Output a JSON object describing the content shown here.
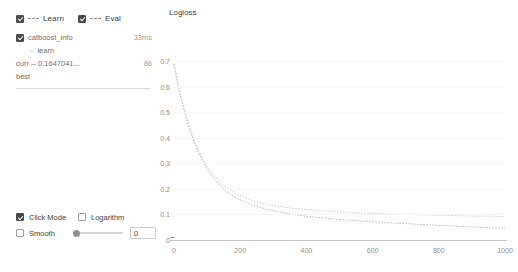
{
  "legend": {
    "items": [
      {
        "label": "Learn",
        "checked": true,
        "style": "dashed",
        "icon": "dashed-line-icon"
      },
      {
        "label": "Eval",
        "checked": true,
        "style": "dashed",
        "icon": "dashed-line-icon"
      }
    ]
  },
  "info_tree": {
    "rows": [
      {
        "name": "catboost_info",
        "right": "33ms",
        "checkbox": true,
        "indent": false,
        "prefix": ""
      },
      {
        "name": "learn",
        "right": "",
        "checkbox": false,
        "indent": true,
        "prefix": "--"
      },
      {
        "name": "curr -- 0.1647041...",
        "right": "86",
        "checkbox": false,
        "indent": false,
        "prefix": ""
      },
      {
        "name": "best",
        "right": "",
        "checkbox": false,
        "indent": false,
        "prefix": ""
      }
    ]
  },
  "controls": {
    "click_mode": {
      "label": "Click Mode",
      "checked": true
    },
    "logarithm": {
      "label": "Logarithm",
      "checked": false
    },
    "smooth": {
      "label": "Smooth",
      "checked": false
    },
    "slider": {
      "value": 0,
      "min": 0,
      "max": 100
    },
    "slider_value_text": "0"
  },
  "chart_data": {
    "type": "line",
    "title": "Logloss",
    "xlabel": "",
    "ylabel": "",
    "xlim": [
      0,
      1000
    ],
    "ylim": [
      0,
      0.72
    ],
    "xticks": [
      0,
      200,
      400,
      600,
      800,
      1000
    ],
    "xtick_labels": [
      "0",
      "200",
      "400",
      "600",
      "800",
      "1000"
    ],
    "yticks": [
      0,
      0.1,
      0.2,
      0.3,
      0.4,
      0.5,
      0.6,
      0.7
    ],
    "ytick_labels": [
      "0",
      "0.1",
      "0.2",
      "0.3",
      "0.4",
      "0.5",
      "0.6",
      "0.7"
    ],
    "grid": true,
    "legend_position": "top-left-panel",
    "series": [
      {
        "name": "Learn",
        "style": "dashed",
        "color": "#b9b9b9",
        "x": [
          0,
          5,
          10,
          15,
          20,
          25,
          30,
          40,
          50,
          60,
          70,
          80,
          90,
          100,
          120,
          140,
          160,
          180,
          200,
          240,
          280,
          320,
          360,
          400,
          460,
          520,
          580,
          640,
          700,
          760,
          820,
          880,
          940,
          1000
        ],
        "y": [
          0.688,
          0.655,
          0.622,
          0.592,
          0.563,
          0.536,
          0.511,
          0.464,
          0.423,
          0.386,
          0.354,
          0.325,
          0.3,
          0.278,
          0.241,
          0.212,
          0.189,
          0.171,
          0.157,
          0.135,
          0.12,
          0.109,
          0.1,
          0.093,
          0.085,
          0.078,
          0.073,
          0.068,
          0.064,
          0.06,
          0.056,
          0.052,
          0.049,
          0.046
        ]
      },
      {
        "name": "Eval",
        "style": "dashed",
        "color": "#cfcfcf",
        "x": [
          0,
          5,
          10,
          15,
          20,
          25,
          30,
          40,
          50,
          60,
          70,
          80,
          90,
          100,
          120,
          140,
          160,
          180,
          200,
          240,
          280,
          320,
          360,
          400,
          460,
          520,
          580,
          640,
          700,
          760,
          820,
          880,
          940,
          1000
        ],
        "y": [
          0.69,
          0.658,
          0.626,
          0.596,
          0.568,
          0.541,
          0.517,
          0.471,
          0.431,
          0.395,
          0.363,
          0.335,
          0.31,
          0.289,
          0.253,
          0.225,
          0.203,
          0.186,
          0.173,
          0.153,
          0.14,
          0.131,
          0.124,
          0.119,
          0.113,
          0.108,
          0.105,
          0.102,
          0.1,
          0.098,
          0.096,
          0.094,
          0.093,
          0.092
        ]
      }
    ]
  }
}
